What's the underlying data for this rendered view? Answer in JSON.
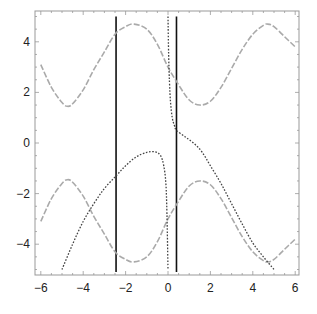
{
  "chart_data": {
    "type": "line",
    "title": "",
    "xlabel": "",
    "ylabel": "",
    "xlim": [
      -6,
      6
    ],
    "ylim": [
      -5.2,
      5.2
    ],
    "grid": false,
    "legend": null,
    "x_ticks": [
      -6,
      -4,
      -2,
      0,
      2,
      4,
      6
    ],
    "x_tick_labels": [
      "−6",
      "−4",
      "−2",
      "0",
      "2",
      "4",
      "6"
    ],
    "y_ticks": [
      -4,
      -2,
      0,
      2,
      4
    ],
    "y_tick_labels": [
      "−4",
      "−2",
      "0",
      "2",
      "4"
    ],
    "series": [
      {
        "name": "upper gray dashed curve",
        "style": "dashed",
        "color": "#aaaaaa",
        "x": [
          -6,
          -5.5,
          -5,
          -4.75,
          -4.5,
          -4,
          -3.5,
          -3,
          -2.5,
          -2,
          -1.6,
          -1,
          -0.5,
          0,
          0.5,
          1,
          1.5,
          2,
          2.5,
          3,
          3.5,
          4,
          4.5,
          4.7,
          5,
          5.5,
          6
        ],
        "y": [
          3.1,
          2.2,
          1.6,
          1.45,
          1.55,
          2.1,
          2.9,
          3.6,
          4.3,
          4.6,
          4.7,
          4.5,
          3.9,
          3.0,
          2.3,
          1.7,
          1.5,
          1.65,
          2.2,
          2.95,
          3.7,
          4.3,
          4.65,
          4.7,
          4.6,
          4.2,
          3.8
        ]
      },
      {
        "name": "lower gray dashed curve",
        "style": "dashed",
        "color": "#aaaaaa",
        "x": [
          -6,
          -5.5,
          -5,
          -4.75,
          -4.5,
          -4,
          -3.5,
          -3,
          -2.5,
          -2,
          -1.6,
          -1,
          -0.5,
          0,
          0.5,
          1,
          1.5,
          2,
          2.5,
          3,
          3.5,
          4,
          4.5,
          4.7,
          5,
          5.5,
          6
        ],
        "y": [
          -3.1,
          -2.2,
          -1.6,
          -1.45,
          -1.55,
          -2.1,
          -2.9,
          -3.6,
          -4.3,
          -4.6,
          -4.7,
          -4.5,
          -3.9,
          -3.0,
          -2.3,
          -1.7,
          -1.5,
          -1.65,
          -2.2,
          -2.95,
          -3.7,
          -4.3,
          -4.65,
          -4.7,
          -4.6,
          -4.2,
          -3.8
        ]
      },
      {
        "name": "dotted curve left branch",
        "style": "dotted",
        "color": "#444444",
        "x": [
          -5.0,
          -4.5,
          -4.0,
          -3.5,
          -3.0,
          -2.45,
          -2.0,
          -1.5,
          -1.0,
          -0.6,
          -0.35,
          -0.2,
          -0.1,
          -0.05,
          0.0
        ],
        "y": [
          -5.0,
          -4.0,
          -3.1,
          -2.4,
          -1.8,
          -1.3,
          -0.9,
          -0.55,
          -0.37,
          -0.35,
          -0.5,
          -0.9,
          -1.6,
          -2.8,
          -5.0
        ]
      },
      {
        "name": "dotted curve right branch",
        "style": "dotted",
        "color": "#444444",
        "x": [
          0.0,
          0.03,
          0.07,
          0.12,
          0.2,
          0.3,
          0.4,
          0.8,
          1.2,
          1.6,
          2.0,
          2.5,
          3.0,
          3.5,
          4.0,
          4.5,
          5.0
        ],
        "y": [
          5.0,
          3.5,
          2.4,
          1.6,
          1.0,
          0.7,
          0.5,
          0.25,
          0.0,
          -0.35,
          -0.9,
          -1.6,
          -2.4,
          -3.2,
          -3.95,
          -4.5,
          -5.0
        ]
      }
    ],
    "vertical_lines": [
      {
        "name": "solid vertical line left",
        "x": -2.45,
        "y_range": [
          -5.1,
          5.0
        ],
        "color": "#111111"
      },
      {
        "name": "solid vertical line right",
        "x": 0.4,
        "y_range": [
          -5.1,
          5.0
        ],
        "color": "#111111"
      }
    ]
  },
  "layout": {
    "frame": {
      "left": 35,
      "right": 299,
      "top": 11,
      "bottom": 275
    },
    "x_pixel_at_zero": 168,
    "x_pixels_per_unit": 21.2,
    "y_pixel_at_zero": 143,
    "y_pixels_per_unit": 25.3
  }
}
